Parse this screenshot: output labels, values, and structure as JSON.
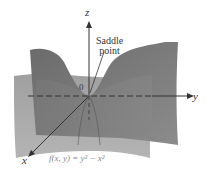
{
  "figure": {
    "axes": {
      "x_label": "x",
      "y_label": "y",
      "z_label": "z",
      "origin_label": "0"
    },
    "annotation": {
      "line1": "Saddle",
      "line2": "point"
    },
    "function_label": "f(x, y) = y² − x²",
    "colors": {
      "surface_dark": "#6e6e6e",
      "surface_mid": "#8a8a8a",
      "surface_light": "#a8a8a8",
      "axis": "#333333",
      "background": "#ffffff"
    }
  }
}
